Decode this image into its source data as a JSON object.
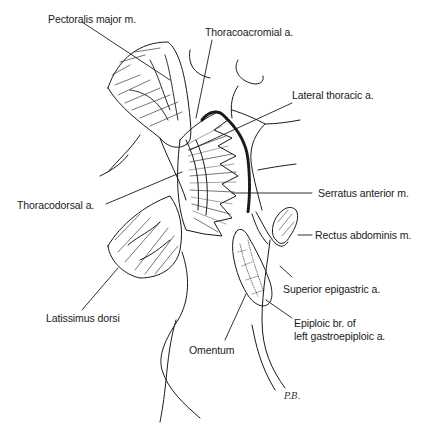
{
  "figure": {
    "labels": {
      "pectoralis_major": "Pectoralis major m.",
      "thoracoacromial": "Thoracoacromial a.",
      "lateral_thoracic": "Lateral thoracic a.",
      "thoracodorsal": "Thoracodorsal a.",
      "serratus_anterior": "Serratus anterior m.",
      "rectus_abdominis": "Rectus abdominis m.",
      "superior_epigastric": "Superior epigastric a.",
      "latissimus_dorsi": "Latissimus dorsi",
      "epiploic_line1": "Epiploic br. of",
      "epiploic_line2": "left gastroepiploic a.",
      "omentum": "Omentum"
    },
    "signature": "P.B.",
    "colors": {
      "ink": "#1a1a1a",
      "background": "#ffffff"
    }
  }
}
